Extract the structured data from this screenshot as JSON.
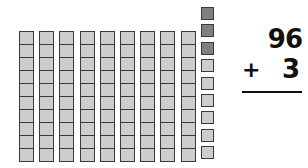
{
  "manipulatives": {
    "tens_rods": 9,
    "cells_per_rod": 10,
    "unit_cubes": [
      {
        "shade": "dark"
      },
      {
        "shade": "dark"
      },
      {
        "shade": "dark"
      },
      {
        "shade": "light"
      },
      {
        "shade": "light"
      },
      {
        "shade": "light"
      },
      {
        "shade": "light"
      },
      {
        "shade": "light"
      },
      {
        "shade": "light"
      }
    ],
    "colors": {
      "light": "#cdcdcd",
      "dark": "#808080",
      "outline": "#3a3a3a"
    }
  },
  "problem": {
    "addend_top": "96",
    "operator": "+",
    "addend_bottom": "3"
  }
}
